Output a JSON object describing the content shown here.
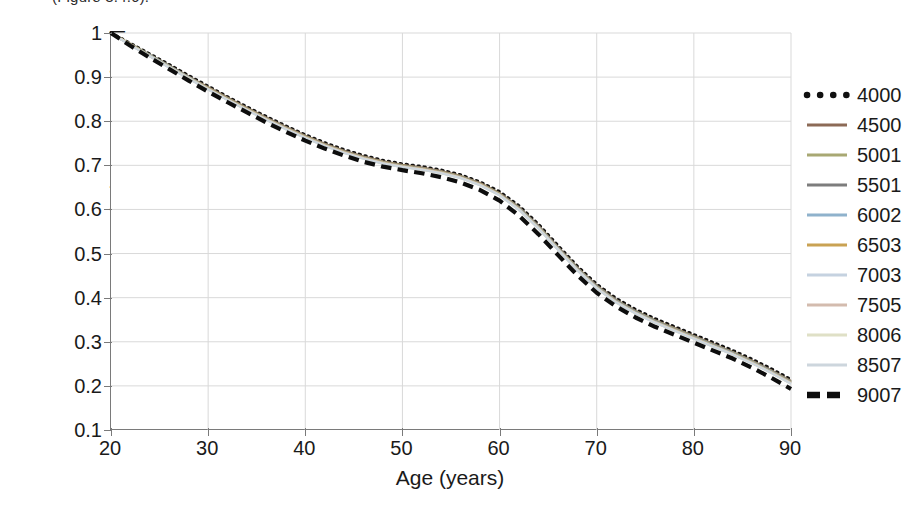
{
  "caption_fragment": "(Figure 3.4.6).",
  "chart_data": {
    "type": "line",
    "title": "",
    "xlabel": "Age (years)",
    "ylabel": "Relative S-cone signal",
    "xlim": [
      20,
      90
    ],
    "ylim": [
      0.1,
      1.0
    ],
    "xticks": [
      20,
      30,
      40,
      50,
      60,
      70,
      80,
      90
    ],
    "yticks": [
      "1",
      "0.9",
      "0.8",
      "0.7",
      "0.6",
      "0.5",
      "0.4",
      "0.3",
      "0.2",
      "0.1"
    ],
    "ytick_values": [
      1.0,
      0.9,
      0.8,
      0.7,
      0.6,
      0.5,
      0.4,
      0.3,
      0.2,
      0.1
    ],
    "grid": true,
    "grid_color": "#d9d9d9",
    "legend_position": "right",
    "x": [
      20,
      22,
      24,
      26,
      28,
      30,
      32,
      34,
      36,
      38,
      40,
      42,
      44,
      46,
      48,
      50,
      52,
      54,
      56,
      58,
      60,
      62,
      64,
      66,
      68,
      70,
      72,
      74,
      76,
      78,
      80,
      82,
      84,
      86,
      88,
      90
    ],
    "series": [
      {
        "name": "4000",
        "color": "#111111",
        "style": "dotted",
        "width": 3.4,
        "values": [
          1.0,
          0.976,
          0.952,
          0.928,
          0.903,
          0.879,
          0.855,
          0.832,
          0.81,
          0.789,
          0.769,
          0.751,
          0.735,
          0.722,
          0.711,
          0.703,
          0.697,
          0.689,
          0.678,
          0.662,
          0.64,
          0.608,
          0.566,
          0.518,
          0.471,
          0.43,
          0.398,
          0.373,
          0.352,
          0.334,
          0.316,
          0.298,
          0.28,
          0.26,
          0.238,
          0.214
        ]
      },
      {
        "name": "4500",
        "color": "#8c6a56",
        "style": "solid",
        "width": 2.2,
        "values": [
          1.0,
          0.975,
          0.95,
          0.926,
          0.901,
          0.877,
          0.853,
          0.83,
          0.808,
          0.787,
          0.767,
          0.749,
          0.733,
          0.72,
          0.709,
          0.701,
          0.695,
          0.687,
          0.676,
          0.66,
          0.637,
          0.605,
          0.563,
          0.515,
          0.468,
          0.427,
          0.395,
          0.37,
          0.349,
          0.331,
          0.313,
          0.295,
          0.277,
          0.257,
          0.235,
          0.211
        ]
      },
      {
        "name": "5001",
        "color": "#a8a873",
        "style": "solid",
        "width": 2.2,
        "values": [
          1.0,
          0.975,
          0.95,
          0.925,
          0.9,
          0.876,
          0.852,
          0.829,
          0.807,
          0.786,
          0.766,
          0.748,
          0.732,
          0.719,
          0.708,
          0.7,
          0.694,
          0.686,
          0.675,
          0.659,
          0.636,
          0.604,
          0.562,
          0.514,
          0.467,
          0.426,
          0.394,
          0.369,
          0.348,
          0.33,
          0.312,
          0.294,
          0.276,
          0.256,
          0.234,
          0.21
        ]
      },
      {
        "name": "5501",
        "color": "#7d7d7d",
        "style": "solid",
        "width": 2.2,
        "values": [
          1.0,
          0.974,
          0.949,
          0.924,
          0.899,
          0.875,
          0.851,
          0.828,
          0.806,
          0.785,
          0.765,
          0.747,
          0.731,
          0.718,
          0.707,
          0.699,
          0.693,
          0.685,
          0.674,
          0.658,
          0.635,
          0.603,
          0.561,
          0.513,
          0.466,
          0.425,
          0.393,
          0.368,
          0.347,
          0.329,
          0.311,
          0.293,
          0.275,
          0.255,
          0.233,
          0.209
        ]
      },
      {
        "name": "6002",
        "color": "#8fb2cc",
        "style": "solid",
        "width": 2.2,
        "values": [
          1.0,
          0.974,
          0.949,
          0.924,
          0.899,
          0.874,
          0.85,
          0.827,
          0.805,
          0.784,
          0.764,
          0.746,
          0.73,
          0.717,
          0.706,
          0.698,
          0.692,
          0.684,
          0.673,
          0.657,
          0.634,
          0.602,
          0.56,
          0.512,
          0.465,
          0.424,
          0.392,
          0.367,
          0.346,
          0.328,
          0.31,
          0.292,
          0.274,
          0.254,
          0.232,
          0.208
        ]
      },
      {
        "name": "6503",
        "color": "#c9a253",
        "style": "solid",
        "width": 2.2,
        "values": [
          1.0,
          0.974,
          0.948,
          0.923,
          0.898,
          0.874,
          0.85,
          0.827,
          0.805,
          0.784,
          0.764,
          0.746,
          0.73,
          0.717,
          0.706,
          0.698,
          0.692,
          0.684,
          0.673,
          0.657,
          0.634,
          0.601,
          0.559,
          0.511,
          0.464,
          0.423,
          0.391,
          0.366,
          0.345,
          0.327,
          0.309,
          0.291,
          0.273,
          0.253,
          0.231,
          0.207
        ]
      },
      {
        "name": "7003",
        "color": "#c5d2e0",
        "style": "solid",
        "width": 2.2,
        "values": [
          1.0,
          0.973,
          0.948,
          0.923,
          0.898,
          0.873,
          0.849,
          0.826,
          0.804,
          0.783,
          0.763,
          0.745,
          0.729,
          0.716,
          0.705,
          0.697,
          0.691,
          0.683,
          0.672,
          0.656,
          0.633,
          0.6,
          0.558,
          0.51,
          0.463,
          0.422,
          0.39,
          0.365,
          0.344,
          0.326,
          0.308,
          0.29,
          0.272,
          0.252,
          0.23,
          0.206
        ]
      },
      {
        "name": "7505",
        "color": "#d3bbae",
        "style": "solid",
        "width": 2.2,
        "values": [
          1.0,
          0.973,
          0.947,
          0.922,
          0.897,
          0.873,
          0.849,
          0.826,
          0.804,
          0.783,
          0.763,
          0.745,
          0.729,
          0.716,
          0.705,
          0.697,
          0.691,
          0.683,
          0.672,
          0.656,
          0.633,
          0.6,
          0.558,
          0.51,
          0.463,
          0.422,
          0.39,
          0.365,
          0.344,
          0.326,
          0.308,
          0.29,
          0.272,
          0.252,
          0.23,
          0.206
        ]
      },
      {
        "name": "8006",
        "color": "#dfe0c6",
        "style": "solid",
        "width": 2.2,
        "values": [
          1.0,
          0.973,
          0.947,
          0.922,
          0.897,
          0.872,
          0.848,
          0.825,
          0.803,
          0.782,
          0.762,
          0.744,
          0.728,
          0.715,
          0.704,
          0.696,
          0.69,
          0.682,
          0.671,
          0.655,
          0.632,
          0.599,
          0.557,
          0.509,
          0.462,
          0.421,
          0.389,
          0.364,
          0.343,
          0.325,
          0.307,
          0.289,
          0.271,
          0.251,
          0.229,
          0.205
        ]
      },
      {
        "name": "8507",
        "color": "#cdd6dd",
        "style": "solid",
        "width": 2.2,
        "values": [
          1.0,
          0.972,
          0.947,
          0.921,
          0.896,
          0.872,
          0.848,
          0.825,
          0.803,
          0.782,
          0.762,
          0.744,
          0.728,
          0.715,
          0.704,
          0.696,
          0.69,
          0.682,
          0.671,
          0.655,
          0.632,
          0.599,
          0.557,
          0.509,
          0.462,
          0.421,
          0.389,
          0.364,
          0.343,
          0.325,
          0.307,
          0.289,
          0.271,
          0.251,
          0.229,
          0.205
        ]
      },
      {
        "name": "9007",
        "color": "#0d0d0d",
        "style": "dashed",
        "width": 4.2,
        "values": [
          1.0,
          0.971,
          0.944,
          0.918,
          0.892,
          0.867,
          0.843,
          0.82,
          0.797,
          0.776,
          0.756,
          0.738,
          0.722,
          0.708,
          0.697,
          0.689,
          0.682,
          0.673,
          0.661,
          0.644,
          0.62,
          0.586,
          0.544,
          0.497,
          0.451,
          0.411,
          0.38,
          0.355,
          0.334,
          0.316,
          0.298,
          0.28,
          0.262,
          0.241,
          0.218,
          0.193
        ]
      }
    ]
  }
}
